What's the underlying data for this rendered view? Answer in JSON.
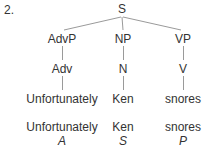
{
  "example_number": "2.",
  "tree": {
    "root": "S",
    "phrases": [
      "AdvP",
      "NP",
      "VP"
    ],
    "heads": [
      "Adv",
      "N",
      "V"
    ],
    "words": [
      "Unfortunately",
      "Ken",
      "snores"
    ]
  },
  "analysis": {
    "words": [
      "Unfortunately",
      "Ken",
      "snores"
    ],
    "functions": [
      "A",
      "S",
      "P"
    ]
  },
  "colors": {
    "text": "#333333",
    "lines": "#999999"
  }
}
